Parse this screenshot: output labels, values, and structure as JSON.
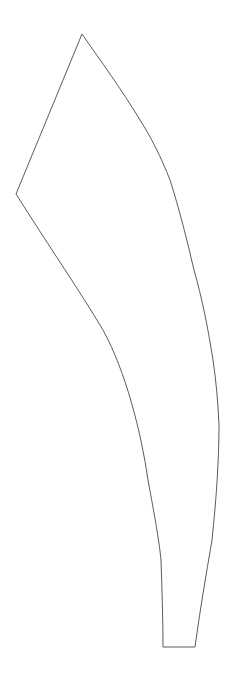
{
  "canvas": {
    "width": 236,
    "height": 694,
    "background_color": "#ffffff"
  },
  "drawing": {
    "name": "curved-tapered-blade-outline",
    "description": "Single closed line-drawing outline of a curved, tapered blade-like form",
    "stroke_color": "#4a4a4a",
    "fill_color": "#ffffff",
    "stroke_width": 0.9,
    "vertices": {
      "apex_top": [
        82,
        34
      ],
      "left_notch": [
        16,
        194
      ],
      "bottom_left": [
        163,
        647
      ],
      "bottom_right": [
        195,
        647
      ]
    },
    "path": "M 82 34 L 16 194 C 48 245 78 288 103 330 C 126 372 141 432 148 480 C 155 518 159 540 161 560 C 162 590 163 620 163 647 L 195 647 C 200 610 206 575 212 540 C 216 502 219 462 219 425 C 218 402 216 380 213 360 C 208 328 202 298 194 270 C 187 240 179 208 170 180 C 161 157 151 137 140 120 C 122 90 100 60 82 34 Z",
    "segments": [
      {
        "name": "top-left-straight-edge",
        "from": [
          82,
          34
        ],
        "to": [
          16,
          194
        ],
        "kind": "line"
      },
      {
        "name": "inner-concave-curve",
        "from": [
          16,
          194
        ],
        "to": [
          163,
          647
        ],
        "kind": "curve"
      },
      {
        "name": "bottom-straight-edge",
        "from": [
          163,
          647
        ],
        "to": [
          195,
          647
        ],
        "kind": "line"
      },
      {
        "name": "outer-convex-curve",
        "from": [
          195,
          647
        ],
        "to": [
          82,
          34
        ],
        "kind": "curve"
      }
    ]
  }
}
